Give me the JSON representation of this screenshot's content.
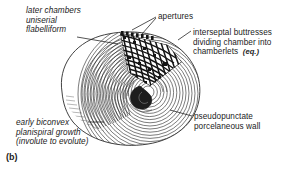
{
  "figure": {
    "caption": "(b)",
    "colors": {
      "background": "#ffffff",
      "ink": "#1b1b1b",
      "line": "#2b2b2b",
      "shade": "#777777"
    }
  },
  "labels": {
    "later_chambers": {
      "line1": "later chambers",
      "line2": "uniserial",
      "line3": "flabelliform",
      "style": "italic"
    },
    "apertures": {
      "line1": "apertures",
      "style": "regular"
    },
    "interseptal": {
      "line1": "interseptal buttresses",
      "line2": "dividing chamber into",
      "line3": "chamberlets",
      "line3_emphasis": "(eq.)",
      "style": "regular"
    },
    "early_growth": {
      "line1": "early biconvex",
      "line2": "planispiral growth",
      "line3": "(involute to evolute)",
      "style": "italic"
    },
    "pseudopunctate": {
      "line1": "pseudopunctate",
      "line2": "porcelaneous wall",
      "style": "regular"
    }
  }
}
